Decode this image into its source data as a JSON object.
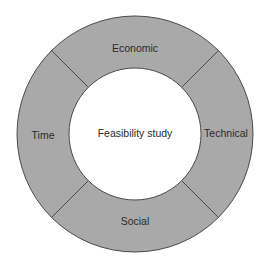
{
  "diagram": {
    "type": "ring",
    "center_label": "Feasibility study",
    "segments": [
      {
        "label": "Economic",
        "position": "top"
      },
      {
        "label": "Technical",
        "position": "right"
      },
      {
        "label": "Social",
        "position": "bottom"
      },
      {
        "label": "Time",
        "position": "left"
      }
    ],
    "colors": {
      "ring_fill": "#a9a9a9",
      "stroke": "#4a4a4a",
      "inner_fill": "#ffffff",
      "text": "#2a2a2a"
    }
  }
}
